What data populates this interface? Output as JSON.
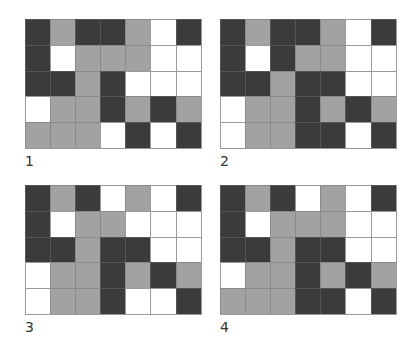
{
  "legend_colors": {
    "D": "#3b3b3b",
    "G": "#a2a2a2",
    "W": "#ffffff"
  },
  "panels": [
    {
      "label": "1",
      "rows": [
        [
          "D",
          "G",
          "D",
          "D",
          "G",
          "W",
          "D"
        ],
        [
          "D",
          "W",
          "G",
          "G",
          "G",
          "W",
          "W"
        ],
        [
          "D",
          "D",
          "G",
          "D",
          "W",
          "W",
          "W"
        ],
        [
          "W",
          "G",
          "G",
          "D",
          "G",
          "D",
          "G"
        ],
        [
          "G",
          "G",
          "G",
          "W",
          "D",
          "W",
          "D"
        ]
      ]
    },
    {
      "label": "2",
      "rows": [
        [
          "D",
          "G",
          "D",
          "D",
          "G",
          "W",
          "D"
        ],
        [
          "D",
          "W",
          "D",
          "G",
          "G",
          "W",
          "W"
        ],
        [
          "D",
          "D",
          "G",
          "D",
          "D",
          "W",
          "W"
        ],
        [
          "W",
          "G",
          "G",
          "D",
          "G",
          "D",
          "G"
        ],
        [
          "W",
          "G",
          "G",
          "D",
          "D",
          "W",
          "D"
        ]
      ]
    },
    {
      "label": "3",
      "rows": [
        [
          "D",
          "G",
          "D",
          "W",
          "G",
          "W",
          "D"
        ],
        [
          "D",
          "W",
          "G",
          "G",
          "W",
          "W",
          "W"
        ],
        [
          "D",
          "D",
          "G",
          "D",
          "D",
          "W",
          "W"
        ],
        [
          "W",
          "G",
          "G",
          "D",
          "G",
          "D",
          "G"
        ],
        [
          "W",
          "G",
          "G",
          "D",
          "W",
          "W",
          "D"
        ]
      ]
    },
    {
      "label": "4",
      "rows": [
        [
          "D",
          "G",
          "D",
          "W",
          "G",
          "W",
          "D"
        ],
        [
          "D",
          "W",
          "G",
          "G",
          "G",
          "W",
          "W"
        ],
        [
          "D",
          "D",
          "G",
          "D",
          "D",
          "W",
          "W"
        ],
        [
          "W",
          "G",
          "G",
          "D",
          "G",
          "D",
          "G"
        ],
        [
          "G",
          "G",
          "G",
          "D",
          "D",
          "W",
          "D"
        ]
      ]
    }
  ]
}
